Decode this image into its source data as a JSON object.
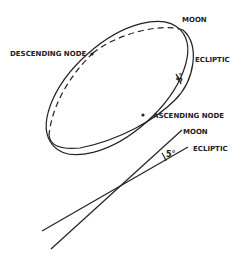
{
  "diagram": {
    "top": {
      "labels": {
        "moon": "MOON",
        "ecliptic": "ECLIPTIC",
        "descending_node": "DESCENDING NODE",
        "ascending_node": "ASCENDING NODE",
        "angle": "5°"
      }
    },
    "bottom": {
      "labels": {
        "moon": "MOON",
        "ecliptic": "ECLIPTIC",
        "angle": "5°"
      }
    },
    "colors": {
      "line": "#222222",
      "background": "#ffffff"
    }
  }
}
